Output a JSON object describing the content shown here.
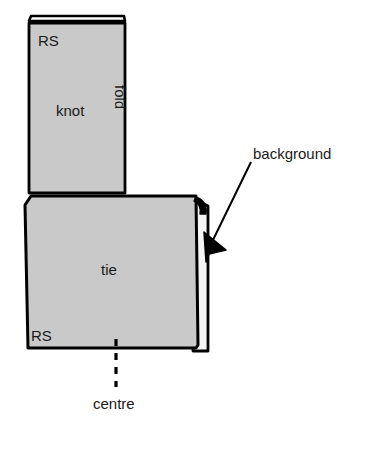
{
  "figure": {
    "labels": {
      "rs_top": "RS",
      "knot": "knot",
      "fold": "fold",
      "tie": "tie",
      "rs_bottom": "RS",
      "centre": "centre",
      "background": "background"
    },
    "colors": {
      "fabric_fill": "#c9c9c9",
      "backing_fill": "#f2f2f2",
      "outline": "#000000",
      "page_background": "#ffffff",
      "text": "#1a1a1a"
    },
    "shapes": {
      "knot_panel": "vertical rectangle, top-left, grey fill with black outline and thin white folded strip across its top edge",
      "tie_panel": "large rectangle below-right of knot, grey fill with black outline",
      "fold_strip": "narrow white strip with black outline along the right edge of the tie panel",
      "centre_line": "vertical dashed line below the tie panel",
      "background_arrow": "straight leader line from the background label down-left to a solid filled arrowhead touching the white fold strip"
    }
  }
}
